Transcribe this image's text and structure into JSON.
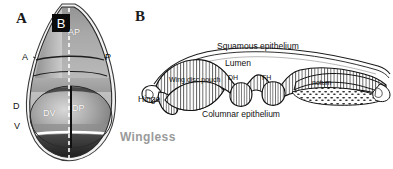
{
  "figure": {
    "panel_a": {
      "letter": "A",
      "inset_box_label": "B",
      "axis_labels": {
        "anterior": "A",
        "posterior": "P",
        "dorsal": "D",
        "ventral": "V"
      },
      "compartments": {
        "ap": "AP",
        "dv": "DV",
        "dp": "DP"
      },
      "caption": "Wingless",
      "caption_color": "#9a9a9a"
    },
    "panel_b": {
      "letter": "B",
      "labels": {
        "squamous": "Squamous epithelium",
        "lumen": "Lumen",
        "columnar": "Columnar epithelium",
        "hinge": "Hinge",
        "pouch": "Wing disc pouch",
        "dh": "DH",
        "fh": "FH",
        "notum": "notum"
      }
    }
  }
}
